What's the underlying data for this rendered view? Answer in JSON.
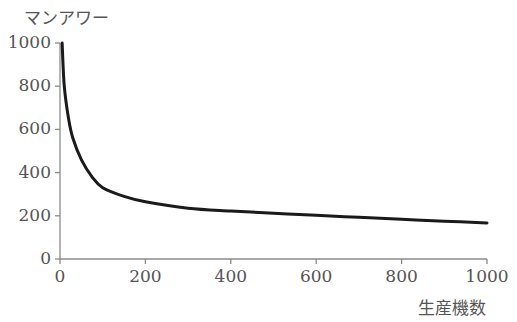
{
  "chart_data": {
    "type": "line",
    "title": "",
    "ylabel": "マンアワー",
    "xlabel": "生産機数",
    "xlim": [
      0,
      1000
    ],
    "ylim": [
      0,
      1000
    ],
    "xticks": [
      0,
      200,
      400,
      600,
      800,
      1000
    ],
    "yticks": [
      0,
      200,
      400,
      600,
      800,
      1000
    ],
    "grid": false,
    "legend": "none",
    "series": [
      {
        "name": "マンアワー",
        "x": [
          5,
          10,
          20,
          30,
          50,
          75,
          100,
          150,
          200,
          300,
          400,
          500,
          600,
          700,
          800,
          900,
          1000
        ],
        "values": [
          1000,
          800,
          650,
          560,
          460,
          380,
          330,
          290,
          265,
          235,
          222,
          212,
          202,
          193,
          184,
          175,
          167
        ]
      }
    ],
    "line_color": "#1a1a1a"
  }
}
